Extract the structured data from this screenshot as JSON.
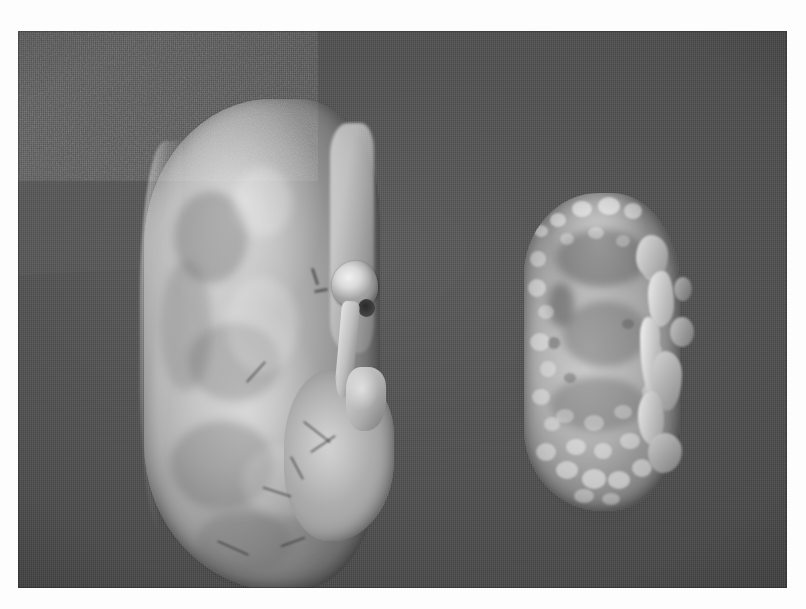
{
  "page": {
    "kind": "specimen-photograph",
    "medium": "black-and-white photographic print",
    "caption": "",
    "background_color": "#fdfdfd"
  },
  "photo": {
    "name": "gross-pathology-photograph",
    "subject": "Two kidneys compared side by side",
    "backdrop_color": "#4b4b4b",
    "backdrop_material": "dark gray cloth",
    "frame": {
      "left": 18,
      "top": 31,
      "width": 769,
      "height": 557
    },
    "tone": {
      "highlight": "#efece6",
      "midtone": "#ada69d",
      "shadow": "#6f6963"
    }
  },
  "specimens": [
    {
      "id": "specimen-left",
      "label": "",
      "position": "left",
      "description": "Large bean-shaped kidney with smooth pale cortical surface",
      "relative_size": "normal / enlarged",
      "surface": "smooth, glistening capsule with faint mottling",
      "features": [
        {
          "name": "renal-vessel",
          "description": "pale vascular stump at hilum"
        },
        {
          "name": "renal-vessel-lumen",
          "description": "dark vessel lumen"
        },
        {
          "name": "ureter",
          "description": "pale tubular structure descending from hilum"
        },
        {
          "name": "hilar-fat",
          "description": "bright hilar fat and connective tissue"
        },
        {
          "name": "lower-pole",
          "description": "rounded bulge along medial lower pole"
        }
      ],
      "bounds": {
        "left": 112,
        "top": 40,
        "width": 265,
        "height": 530
      }
    },
    {
      "id": "specimen-right",
      "label": "",
      "position": "right",
      "description": "Small contracted kidney with coarsely granular nodular surface and broad depressed scars",
      "relative_size": "markedly reduced",
      "surface": "coarse granular, irregularly scarred",
      "features": [
        {
          "name": "granular-nodules",
          "description": "numerous fine surface granules"
        },
        {
          "name": "cortical-scar",
          "description": "broad depressed scarred zones"
        },
        {
          "name": "hilar-shreds",
          "description": "ragged capsular and hilar tissue along medial border"
        }
      ],
      "bounds": {
        "left": 486,
        "top": 140,
        "width": 210,
        "height": 360
      }
    }
  ]
}
